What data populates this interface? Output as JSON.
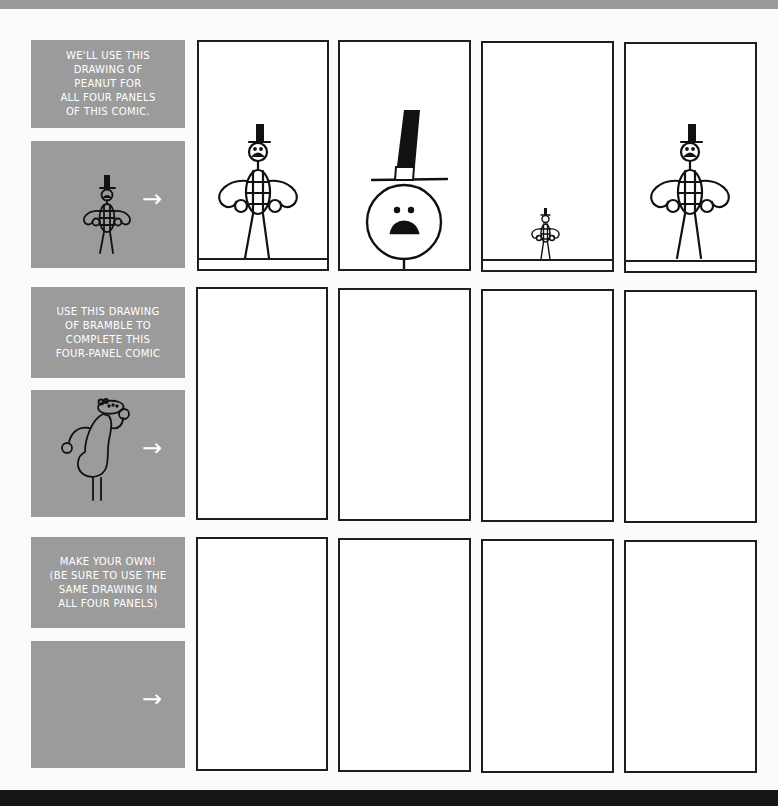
{
  "rows": [
    {
      "caption": "WE'LL USE THIS\nDRAWING OF\nPEANUT FOR\nALL FOUR PANELS\nOF THIS COMIC.",
      "character": "peanut",
      "arrow": "→",
      "panels": [
        "peanut-medium",
        "peanut-closeup",
        "peanut-small",
        "peanut-medium"
      ]
    },
    {
      "caption": "USE THIS DRAWING\nOF BRAMBLE TO\nCOMPLETE THIS\nFOUR-PANEL COMIC",
      "character": "bramble",
      "arrow": "→",
      "panels": [
        "empty",
        "empty",
        "empty",
        "empty"
      ]
    },
    {
      "caption": "MAKE YOUR OWN!\n(BE SURE TO USE THE\nSAME DRAWING IN\nALL FOUR PANELS)",
      "character": "none",
      "arrow": "→",
      "panels": [
        "empty",
        "empty",
        "empty",
        "empty"
      ]
    }
  ],
  "colors": {
    "caption_bg": "#9b9b9b",
    "caption_text": "#ffffff",
    "panel_border": "#1e1e1e",
    "panel_bg": "#ffffff",
    "page_bg": "#fbfbfb"
  }
}
